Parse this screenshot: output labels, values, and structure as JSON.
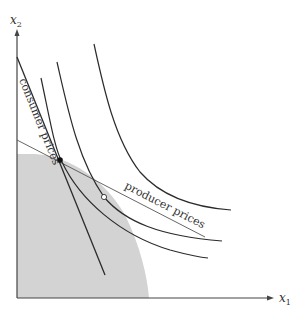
{
  "figure": {
    "axes": {
      "x_label": "x",
      "x_subscript": "1",
      "y_label": "x",
      "y_subscript": "2"
    },
    "labels": {
      "consumer_line": "consumer prices",
      "producer_line": "producer prices"
    },
    "colors": {
      "axis": "#444444",
      "curve": "#2b2b2b",
      "shaded_region": "#d3d3d3",
      "producer_line": "#555555",
      "background": "#ffffff"
    },
    "elements": [
      "production possibility set (shaded)",
      "three indifference curves",
      "consumer price line tangent at production point",
      "producer price line tangent to production frontier",
      "solid dot at production/consumption point",
      "open circle on producer price line"
    ]
  }
}
